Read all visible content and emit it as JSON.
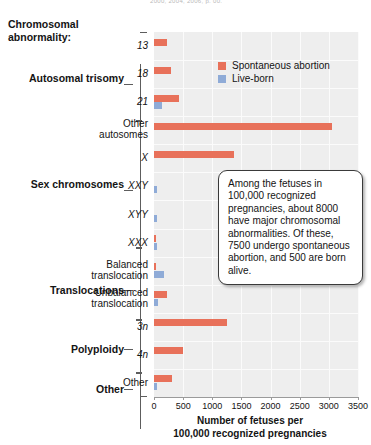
{
  "figure": {
    "top_cropped_text": "2000, 2004, 2006, p. 00.",
    "axis_group_title": "Chromosomal abnormality:",
    "x_axis_title": "Number of fetuses per\n100,000 recognized pregnancies"
  },
  "legend": {
    "position": "top-right-inside-plot",
    "entries": [
      {
        "label": "Spontaneous abortion",
        "color": "#e8715a",
        "key": "spontaneous_abortion"
      },
      {
        "label": "Live-born",
        "color": "#8fabd7",
        "key": "live_born"
      }
    ]
  },
  "callout": {
    "text": "Among the fetuses in 100,000 recognized pregnancies, about 8000 have major chromosomal abnormalities. Of these, 7500 undergo spontaneous abortion, and 500 are born alive."
  },
  "groups": [
    {
      "label": "Autosomal\ntrisomy",
      "categories": [
        "13",
        "18",
        "21",
        "Other autosomes"
      ]
    },
    {
      "label": "Sex\nchromosomes",
      "categories": [
        "X",
        "XXY",
        "XYY",
        "XXX"
      ]
    },
    {
      "label": "Translocations",
      "categories": [
        "Balanced translocation",
        "Unbalanced translocation"
      ]
    },
    {
      "label": "Polyploidy",
      "categories": [
        "3n",
        "4n"
      ]
    },
    {
      "label": "Other",
      "categories": [
        "Other"
      ]
    }
  ],
  "chart_data": {
    "type": "bar",
    "orientation": "horizontal",
    "title": "",
    "xlabel": "Number of fetuses per 100,000 recognized pregnancies",
    "ylabel": "Chromosomal abnormality:",
    "xlim": [
      0,
      3500
    ],
    "xticks": [
      0,
      500,
      1000,
      1500,
      2000,
      2500,
      3000,
      3500
    ],
    "grid": true,
    "grid_color": "#fbfbfb",
    "plot_background": "#eeeeee",
    "categories": [
      "13",
      "18",
      "21",
      "Other autosomes",
      "X",
      "XXY",
      "XYY",
      "XXX",
      "Balanced translocation",
      "Unbalanced translocation",
      "3n",
      "4n",
      "Other"
    ],
    "category_styles": [
      "italic",
      "italic",
      "italic",
      "plain",
      "italic",
      "italic",
      "italic",
      "italic",
      "plain",
      "plain",
      "italic",
      "italic",
      "plain"
    ],
    "category_groups": [
      "Autosomal trisomy",
      "Autosomal trisomy",
      "Autosomal trisomy",
      "Autosomal trisomy",
      "Sex chromosomes",
      "Sex chromosomes",
      "Sex chromosomes",
      "Sex chromosomes",
      "Translocations",
      "Translocations",
      "Polyploidy",
      "Polyploidy",
      "Other"
    ],
    "series": [
      {
        "name": "Spontaneous abortion",
        "color": "#e8715a",
        "values": [
          225,
          290,
          430,
          3050,
          1370,
          0,
          0,
          25,
          35,
          220,
          1250,
          500,
          305
        ]
      },
      {
        "name": "Live-born",
        "color": "#8fabd7",
        "values": [
          0,
          0,
          135,
          0,
          0,
          60,
          55,
          55,
          170,
          65,
          0,
          0,
          50
        ]
      }
    ]
  }
}
